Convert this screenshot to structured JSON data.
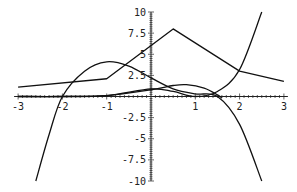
{
  "chart_data": {
    "type": "line",
    "title": "",
    "xlabel": "",
    "ylabel": "",
    "xlim": [
      -3,
      3
    ],
    "ylim": [
      -10,
      10
    ],
    "grid": false,
    "legend": null,
    "x_ticks": [
      "-3",
      "-2",
      "-1",
      "1",
      "2",
      "3"
    ],
    "y_ticks": [
      "10",
      "7.5",
      "5",
      "2.5",
      "-2.5",
      "-5",
      "-7.5",
      "-10"
    ],
    "series": [
      {
        "name": "piecewise-linear",
        "x": [
          -3,
          -1,
          0.5,
          2,
          3
        ],
        "y": [
          1.1,
          2.1,
          8.0,
          3.0,
          1.8
        ]
      },
      {
        "name": "hump-cubic",
        "x": [
          -2.6,
          -2.3,
          -2.0,
          -1.5,
          -1.0,
          -0.5,
          0.0,
          0.5,
          1.0,
          1.5,
          2.0,
          2.5
        ],
        "y": [
          -10,
          -4.5,
          0.0,
          3.0,
          4.1,
          3.6,
          2.2,
          0.9,
          0.3,
          0.0,
          -3.3,
          -10
        ]
      },
      {
        "name": "rising-curve",
        "x": [
          -3,
          -2,
          -1,
          0,
          0.5,
          1.0,
          1.5,
          2.0,
          2.5
        ],
        "y": [
          0.0,
          0.0,
          0.1,
          0.9,
          0.6,
          0.0,
          0.6,
          3.2,
          10
        ]
      },
      {
        "name": "small-hump",
        "x": [
          -3,
          -2,
          -1,
          0,
          0.5,
          0.8,
          1.2,
          1.5,
          1.6
        ],
        "y": [
          0.0,
          0.0,
          0.1,
          0.8,
          1.3,
          1.4,
          1.0,
          0.2,
          -0.2
        ]
      }
    ]
  }
}
